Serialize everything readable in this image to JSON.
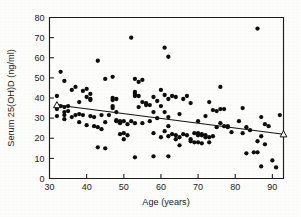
{
  "figure": {
    "background_color": "#fdfdfc",
    "ink_color": "#0d0d0d"
  },
  "chart_data": {
    "type": "scatter",
    "title": "",
    "xlabel": "Age (years)",
    "ylabel": "Serum 25(OH)D (ng/ml)",
    "xlim": [
      30,
      93
    ],
    "ylim": [
      0,
      80
    ],
    "xticks": [
      30,
      40,
      50,
      60,
      70,
      80,
      90
    ],
    "yticks": [
      0,
      10,
      20,
      30,
      40,
      50,
      60,
      70,
      80
    ],
    "xtick_labels": [
      "30",
      "40",
      "50",
      "60",
      "70",
      "80",
      "90"
    ],
    "ytick_labels": [
      "0",
      "10",
      "20",
      "30",
      "40",
      "50",
      "60",
      "70",
      "80"
    ],
    "grid": false,
    "legend": null,
    "marker": "filled-circle",
    "marker_color": "#0d0d0d",
    "point_count": 152,
    "points": [
      [
        32,
        41.0
      ],
      [
        32,
        34.5
      ],
      [
        32,
        31.0
      ],
      [
        33,
        53.0
      ],
      [
        33,
        36.0
      ],
      [
        34,
        48.5
      ],
      [
        34,
        35.5
      ],
      [
        34,
        33.0
      ],
      [
        34,
        31.5
      ],
      [
        34,
        29.5
      ],
      [
        35,
        36.0
      ],
      [
        35,
        33.5
      ],
      [
        36,
        44.0
      ],
      [
        36,
        30.5
      ],
      [
        37,
        45.5
      ],
      [
        37,
        31.5
      ],
      [
        38,
        38.0
      ],
      [
        38,
        32.0
      ],
      [
        38,
        28.0
      ],
      [
        39,
        43.5
      ],
      [
        39,
        31.5
      ],
      [
        40,
        44.5
      ],
      [
        40,
        40.5
      ],
      [
        40,
        26.5
      ],
      [
        41,
        42.0
      ],
      [
        41,
        39.5
      ],
      [
        41,
        39.0
      ],
      [
        41,
        31.0
      ],
      [
        42,
        30.5
      ],
      [
        42,
        26.0
      ],
      [
        43,
        58.5
      ],
      [
        43,
        25.5
      ],
      [
        43,
        15.5
      ],
      [
        44,
        31.5
      ],
      [
        44,
        24.5
      ],
      [
        45,
        49.5
      ],
      [
        45,
        28.0
      ],
      [
        45,
        15.0
      ],
      [
        46,
        31.5
      ],
      [
        47,
        50.5
      ],
      [
        47,
        40.0
      ],
      [
        47,
        39.0
      ],
      [
        47,
        36.0
      ],
      [
        47,
        35.0
      ],
      [
        48,
        39.5
      ],
      [
        48,
        33.0
      ],
      [
        48,
        29.0
      ],
      [
        48,
        28.5
      ],
      [
        49,
        28.5
      ],
      [
        49,
        27.5
      ],
      [
        49,
        22.0
      ],
      [
        50,
        28.5
      ],
      [
        50,
        22.5
      ],
      [
        50,
        19.5
      ],
      [
        51,
        27.0
      ],
      [
        51,
        21.5
      ],
      [
        52,
        70.0
      ],
      [
        52,
        28.5
      ],
      [
        53,
        49.5
      ],
      [
        53,
        43.0
      ],
      [
        53,
        42.0
      ],
      [
        53,
        41.0
      ],
      [
        53,
        27.5
      ],
      [
        53,
        10.5
      ],
      [
        54,
        48.0
      ],
      [
        54,
        41.0
      ],
      [
        54,
        35.5
      ],
      [
        55,
        49.0
      ],
      [
        55,
        38.0
      ],
      [
        55,
        27.5
      ],
      [
        56,
        37.5
      ],
      [
        56,
        36.5
      ],
      [
        57,
        36.5
      ],
      [
        57,
        28.5
      ],
      [
        58,
        40.5
      ],
      [
        58,
        33.0
      ],
      [
        58,
        22.5
      ],
      [
        58,
        11.0
      ],
      [
        59,
        38.5
      ],
      [
        59,
        30.0
      ],
      [
        60,
        44.0
      ],
      [
        60,
        36.0
      ],
      [
        60,
        20.5
      ],
      [
        61,
        65.0
      ],
      [
        61,
        41.5
      ],
      [
        61,
        33.0
      ],
      [
        61,
        23.5
      ],
      [
        62,
        60.5
      ],
      [
        62,
        39.5
      ],
      [
        62,
        30.5
      ],
      [
        62,
        26.0
      ],
      [
        62,
        21.0
      ],
      [
        62,
        11.0
      ],
      [
        63,
        41.0
      ],
      [
        63,
        22.0
      ],
      [
        64,
        40.5
      ],
      [
        64,
        21.5
      ],
      [
        64,
        19.5
      ],
      [
        65,
        32.0
      ],
      [
        65,
        20.5
      ],
      [
        65,
        16.5
      ],
      [
        66,
        39.5
      ],
      [
        66,
        22.0
      ],
      [
        67,
        41.0
      ],
      [
        67,
        21.5
      ],
      [
        68,
        37.5
      ],
      [
        68,
        19.5
      ],
      [
        68,
        18.5
      ],
      [
        69,
        22.5
      ],
      [
        69,
        18.0
      ],
      [
        70,
        28.5
      ],
      [
        70,
        22.5
      ],
      [
        70,
        21.5
      ],
      [
        70,
        18.0
      ],
      [
        71,
        22.0
      ],
      [
        71,
        21.5
      ],
      [
        71,
        17.5
      ],
      [
        72,
        31.0
      ],
      [
        72,
        21.5
      ],
      [
        72,
        20.5
      ],
      [
        73,
        38.0
      ],
      [
        73,
        20.5
      ],
      [
        73,
        18.0
      ],
      [
        74,
        34.0
      ],
      [
        74,
        21.0
      ],
      [
        75,
        33.5
      ],
      [
        75,
        25.5
      ],
      [
        76,
        45.5
      ],
      [
        76,
        34.5
      ],
      [
        76,
        27.5
      ],
      [
        77,
        34.5
      ],
      [
        77,
        26.0
      ],
      [
        78,
        26.0
      ],
      [
        78,
        25.5
      ],
      [
        79,
        23.0
      ],
      [
        81,
        28.5
      ],
      [
        82,
        35.0
      ],
      [
        82,
        22.5
      ],
      [
        83,
        25.5
      ],
      [
        83,
        12.5
      ],
      [
        84,
        24.0
      ],
      [
        85,
        13.0
      ],
      [
        86,
        74.5
      ],
      [
        86,
        13.0
      ],
      [
        86,
        18.5
      ],
      [
        87,
        30.5
      ],
      [
        87,
        21.0
      ],
      [
        87,
        6.0
      ],
      [
        88,
        27.0
      ],
      [
        88,
        17.0
      ],
      [
        89,
        26.0
      ],
      [
        90,
        9.0
      ],
      [
        91,
        5.5
      ],
      [
        92,
        31.5
      ]
    ],
    "trendline": {
      "type": "linear-fit",
      "x_start": 32,
      "y_start": 36.5,
      "x_end": 93,
      "y_end": 22.0,
      "endpoint_marker": "open-triangle",
      "color": "#131313"
    }
  }
}
